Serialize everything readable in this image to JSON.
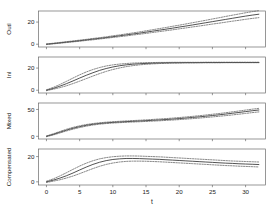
{
  "figure": {
    "background": "#ffffff",
    "line_color": "#333333",
    "ci_color": "#555555",
    "frame_color": "#6a6a6a"
  },
  "axis": {
    "x_label": "t",
    "x_ticks": [
      0,
      5,
      10,
      15,
      20,
      25,
      30
    ],
    "x_tick_labels": [
      "0",
      "5",
      "10",
      "15",
      "20",
      "25",
      "30"
    ],
    "x_min": -1.2,
    "x_max": 33.0
  },
  "chart_data": {
    "type": "line",
    "title": "",
    "xlabel": "t",
    "ylabel": "",
    "grid": false,
    "legend": null,
    "shared_x": true,
    "x": [
      0,
      1,
      2,
      3,
      4,
      5,
      6,
      7,
      8,
      9,
      10,
      11,
      12,
      13,
      14,
      15,
      16,
      17,
      18,
      19,
      20,
      21,
      22,
      23,
      24,
      25,
      26,
      27,
      28,
      29,
      30,
      31,
      32
    ],
    "panels": [
      {
        "label": "Outl",
        "ylim": [
          -2.5,
          30
        ],
        "yticks": [
          0,
          20
        ],
        "ytick_labels": [
          "0",
          "20"
        ],
        "series": [
          {
            "name": "fit",
            "style": "solid",
            "values": [
              0.0,
              0.6,
              1.2,
              1.9,
              2.5,
              3.2,
              3.9,
              4.6,
              5.3,
              6.0,
              6.8,
              7.6,
              8.4,
              9.2,
              10.0,
              10.9,
              11.8,
              12.7,
              13.6,
              14.5,
              15.5,
              16.4,
              17.4,
              18.4,
              19.4,
              20.4,
              21.4,
              22.4,
              23.4,
              24.4,
              25.4,
              26.3,
              27.1
            ]
          },
          {
            "name": "upper-ci",
            "style": "dashed",
            "values": [
              0.3,
              0.9,
              1.6,
              2.3,
              3.0,
              3.7,
              4.4,
              5.2,
              5.9,
              6.7,
              7.6,
              8.4,
              9.3,
              10.2,
              11.1,
              12.1,
              13.1,
              14.1,
              15.1,
              16.2,
              17.2,
              18.3,
              19.4,
              20.5,
              21.6,
              22.8,
              23.9,
              25.1,
              26.2,
              27.3,
              28.4,
              29.4,
              30.3
            ]
          },
          {
            "name": "lower-ci",
            "style": "dashed",
            "values": [
              -0.3,
              0.3,
              0.9,
              1.5,
              2.1,
              2.7,
              3.4,
              4.0,
              4.7,
              5.4,
              6.1,
              6.8,
              7.5,
              8.3,
              9.0,
              9.8,
              10.6,
              11.4,
              12.2,
              13.0,
              13.9,
              14.7,
              15.6,
              16.4,
              17.3,
              18.2,
              19.0,
              19.9,
              20.8,
              21.6,
              22.5,
              23.3,
              24.0
            ]
          }
        ]
      },
      {
        "label": "Inl",
        "ylim": [
          -2.5,
          30
        ],
        "yticks": [
          0,
          20
        ],
        "ytick_labels": [
          "0",
          "20"
        ],
        "series": [
          {
            "name": "fit",
            "style": "solid",
            "values": [
              0.0,
              1.6,
              3.6,
              5.9,
              8.4,
              11.0,
              13.5,
              15.8,
              17.9,
              19.6,
              21.0,
              22.1,
              22.9,
              23.5,
              23.9,
              24.2,
              24.4,
              24.6,
              24.7,
              24.8,
              24.8,
              24.9,
              24.9,
              24.9,
              25.0,
              25.0,
              25.0,
              25.0,
              25.0,
              25.0,
              25.0,
              25.0,
              25.0
            ]
          },
          {
            "name": "upper-ci",
            "style": "dashed",
            "values": [
              0.4,
              2.5,
              5.1,
              8.0,
              11.0,
              13.9,
              16.5,
              18.7,
              20.5,
              21.9,
              22.9,
              23.6,
              24.1,
              24.5,
              24.7,
              24.9,
              25.0,
              25.1,
              25.1,
              25.2,
              25.2,
              25.2,
              25.2,
              25.2,
              25.3,
              25.3,
              25.3,
              25.3,
              25.3,
              25.3,
              25.3,
              25.3,
              25.3
            ]
          },
          {
            "name": "lower-ci",
            "style": "dashed",
            "values": [
              -0.4,
              0.9,
              2.3,
              4.0,
              6.0,
              8.2,
              10.5,
              12.8,
              15.0,
              17.0,
              18.7,
              20.1,
              21.3,
              22.2,
              22.9,
              23.4,
              23.8,
              24.1,
              24.3,
              24.5,
              24.6,
              24.7,
              24.7,
              24.8,
              24.8,
              24.8,
              24.8,
              24.9,
              24.9,
              24.9,
              24.9,
              24.9,
              24.9
            ]
          }
        ]
      },
      {
        "label": "Mixed",
        "ylim": [
          -5,
          62
        ],
        "yticks": [
          0,
          50
        ],
        "ytick_labels": [
          "0",
          "50"
        ],
        "series": [
          {
            "name": "fit",
            "style": "solid",
            "values": [
              0.0,
              3.5,
              7.5,
              11.5,
              15.0,
              18.0,
              20.5,
              22.4,
              23.9,
              25.0,
              25.9,
              26.6,
              27.3,
              27.9,
              28.5,
              29.1,
              29.8,
              30.5,
              31.3,
              32.1,
              33.0,
              34.0,
              35.1,
              36.2,
              37.4,
              38.7,
              40.0,
              41.4,
              42.9,
              44.4,
              46.0,
              47.6,
              49.0
            ]
          },
          {
            "name": "upper-ci",
            "style": "dashed",
            "values": [
              0.7,
              4.6,
              8.9,
              13.1,
              16.7,
              19.6,
              22.0,
              23.8,
              25.2,
              26.3,
              27.2,
              27.9,
              28.6,
              29.3,
              29.9,
              30.6,
              31.4,
              32.2,
              33.0,
              33.9,
              34.9,
              36.0,
              37.1,
              38.3,
              39.6,
              41.0,
              42.4,
              43.9,
              45.5,
              47.1,
              48.8,
              50.5,
              52.0
            ]
          },
          {
            "name": "lower-ci",
            "style": "dashed",
            "values": [
              -0.7,
              2.4,
              6.1,
              9.9,
              13.3,
              16.3,
              18.9,
              21.0,
              22.6,
              23.8,
              24.7,
              25.4,
              26.0,
              26.6,
              27.1,
              27.7,
              28.3,
              28.9,
              29.6,
              30.3,
              31.1,
              32.0,
              32.9,
              33.9,
              35.0,
              36.1,
              37.3,
              38.5,
              39.8,
              41.2,
              42.6,
              44.1,
              45.4
            ]
          }
        ]
      },
      {
        "label": "Compensated",
        "ylim": [
          -2.5,
          26
        ],
        "yticks": [
          0,
          20
        ],
        "ytick_labels": [
          "0",
          "20"
        ],
        "series": [
          {
            "name": "fit",
            "style": "solid",
            "values": [
              0.0,
              1.3,
              2.9,
              4.8,
              7.0,
              9.4,
              11.7,
              13.8,
              15.5,
              16.8,
              17.7,
              18.2,
              18.5,
              18.5,
              18.4,
              18.2,
              18.0,
              17.8,
              17.5,
              17.2,
              16.9,
              16.6,
              16.3,
              16.0,
              15.7,
              15.4,
              15.1,
              14.8,
              14.6,
              14.3,
              14.1,
              13.9,
              13.7
            ]
          },
          {
            "name": "upper-ci",
            "style": "dashed",
            "values": [
              0.5,
              2.3,
              4.6,
              7.2,
              9.9,
              12.5,
              14.8,
              16.7,
              18.2,
              19.2,
              19.9,
              20.3,
              20.5,
              20.5,
              20.4,
              20.2,
              20.0,
              19.8,
              19.5,
              19.2,
              18.9,
              18.6,
              18.3,
              18.0,
              17.7,
              17.4,
              17.1,
              16.8,
              16.5,
              16.3,
              16.1,
              15.9,
              15.7
            ]
          },
          {
            "name": "lower-ci",
            "style": "dashed",
            "values": [
              -0.5,
              0.5,
              1.6,
              3.0,
              4.6,
              6.5,
              8.5,
              10.5,
              12.3,
              13.8,
              14.9,
              15.7,
              16.2,
              16.4,
              16.4,
              16.3,
              16.1,
              15.9,
              15.6,
              15.3,
              15.0,
              14.7,
              14.4,
              14.1,
              13.8,
              13.5,
              13.2,
              12.9,
              12.7,
              12.4,
              12.2,
              12.0,
              11.8
            ]
          }
        ]
      }
    ]
  }
}
